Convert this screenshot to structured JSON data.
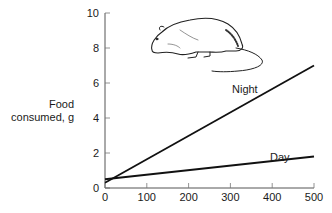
{
  "chart_data": {
    "type": "line",
    "title": "",
    "xlabel": "",
    "ylabel": "Food consumed, g",
    "ylabel_lines": [
      "Food",
      "consumed, g"
    ],
    "xlim": [
      0,
      500
    ],
    "ylim": [
      0,
      10
    ],
    "x_ticks": [
      0,
      100,
      200,
      300,
      400,
      500
    ],
    "y_ticks": [
      0,
      2,
      4,
      6,
      8,
      10
    ],
    "grid": false,
    "legend": "inline labels",
    "series": [
      {
        "name": "Night",
        "x": [
          0,
          500
        ],
        "values": [
          0.3,
          7.0
        ]
      },
      {
        "name": "Day",
        "x": [
          0,
          500
        ],
        "values": [
          0.5,
          1.8
        ]
      }
    ],
    "annotations": [
      "rat illustration (top of plot)"
    ]
  },
  "labels": {
    "night": "Night",
    "day": "Day",
    "ylabel_line1": "Food",
    "ylabel_line2": "consumed, g"
  }
}
